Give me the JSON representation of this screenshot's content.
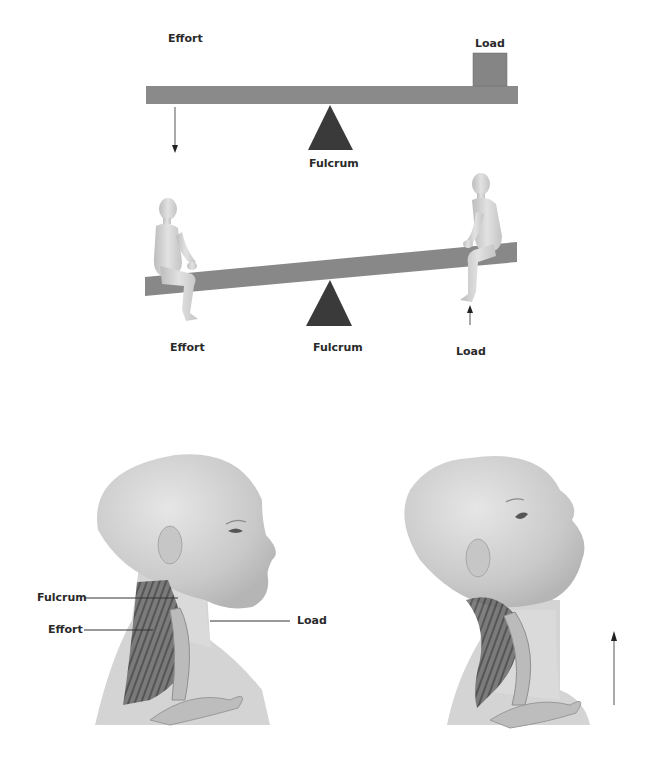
{
  "colors": {
    "beam": "#8a8a8a",
    "beam_dark": "#6e6e6e",
    "load_box": "#858585",
    "fulcrum": "#3a3a3a",
    "figure": "#d8d8d8",
    "skin": "#cfcfcf",
    "muscle": "#555555",
    "text": "#2a2a2a"
  },
  "panel_balance": {
    "effort_label": "Effort",
    "load_label": "Load",
    "fulcrum_label": "Fulcrum"
  },
  "panel_seesaw": {
    "effort_label": "Effort",
    "fulcrum_label": "Fulcrum",
    "load_label": "Load"
  },
  "panel_head_neutral": {
    "fulcrum_label": "Fulcrum",
    "effort_label": "Effort",
    "load_label": "Load"
  },
  "panel_head_extended": {
    "arrow": "upward-arrow"
  }
}
